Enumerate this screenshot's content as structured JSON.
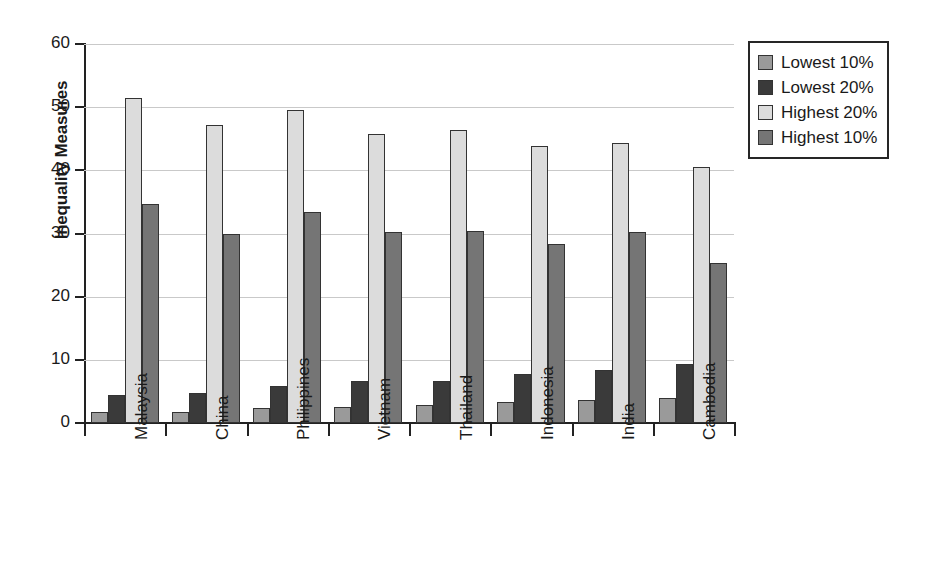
{
  "chart_data": {
    "type": "bar",
    "title": "",
    "xlabel": "",
    "ylabel": "Inequality Measures",
    "ylim": [
      0,
      60
    ],
    "yticks": [
      0,
      10,
      20,
      30,
      40,
      50,
      60
    ],
    "grid": true,
    "legend_position": "right",
    "categories": [
      "Malaysia",
      "China",
      "Philippines",
      "Vietnam",
      "Thailand",
      "Indonesia",
      "India",
      "Cambodia"
    ],
    "series": [
      {
        "name": "Lowest 10%",
        "color": "#9a9a9a",
        "values": [
          1.7,
          1.8,
          2.3,
          2.6,
          2.8,
          3.4,
          3.6,
          4.0
        ]
      },
      {
        "name": "Lowest 20%",
        "color": "#3a3a3a",
        "values": [
          4.4,
          4.7,
          5.9,
          6.6,
          6.7,
          7.7,
          8.4,
          9.4
        ]
      },
      {
        "name": "Highest 20%",
        "color": "#dcdcdc",
        "values": [
          51.5,
          47.2,
          49.6,
          45.8,
          46.4,
          43.8,
          44.4,
          40.5
        ]
      },
      {
        "name": "Highest 10%",
        "color": "#757575",
        "values": [
          34.7,
          30.0,
          33.4,
          30.2,
          30.4,
          28.3,
          30.2,
          25.3
        ]
      }
    ]
  }
}
